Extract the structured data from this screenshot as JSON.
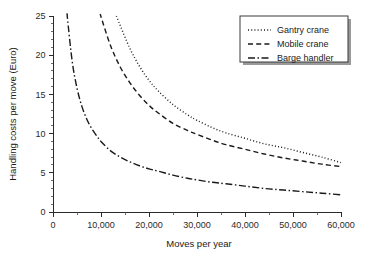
{
  "chart_data": {
    "type": "line",
    "title": "",
    "xlabel": "Moves per year",
    "ylabel": "Handling costs per move (Euro)",
    "xlim": [
      0,
      60000
    ],
    "ylim": [
      0,
      25
    ],
    "grid": false,
    "legend_position": "top-right",
    "x_ticks": [
      0,
      10000,
      20000,
      30000,
      40000,
      50000,
      60000
    ],
    "x_tick_labels": [
      "0",
      "10,000",
      "20,000",
      "30,000",
      "40,000",
      "50,000",
      "60,000"
    ],
    "x_minor_interval": 5000,
    "y_ticks": [
      0,
      5,
      10,
      15,
      20,
      25
    ],
    "y_tick_labels": [
      "0",
      "5",
      "10",
      "15",
      "20",
      "25"
    ],
    "y_minor_interval": 1,
    "x": [
      3000,
      4000,
      5000,
      6000,
      7000,
      8000,
      9000,
      10000,
      12000,
      14000,
      16000,
      18000,
      20000,
      22000,
      25000,
      28000,
      30000,
      33000,
      36000,
      40000,
      44000,
      48000,
      52000,
      56000,
      60000
    ],
    "series": [
      {
        "name": "Gantry crane",
        "style": "dotted",
        "x_start": 13200,
        "values": [
          null,
          null,
          null,
          null,
          null,
          null,
          null,
          null,
          null,
          23.8,
          20.9,
          18.6,
          16.8,
          15.4,
          13.7,
          12.4,
          11.7,
          10.8,
          10.1,
          9.4,
          8.7,
          8.2,
          7.6,
          7.0,
          6.3
        ]
      },
      {
        "name": "Mobile crane",
        "style": "dashed",
        "x_start": 10000,
        "values": [
          null,
          null,
          null,
          null,
          null,
          null,
          null,
          24.9,
          21.2,
          18.5,
          16.5,
          14.9,
          13.6,
          12.6,
          11.3,
          10.4,
          9.9,
          9.2,
          8.6,
          8.0,
          7.4,
          6.9,
          6.5,
          6.1,
          5.8
        ]
      },
      {
        "name": "Barge handler",
        "style": "dashdot",
        "x_start": 3000,
        "values": [
          24.8,
          19.2,
          15.8,
          13.5,
          11.9,
          10.7,
          9.8,
          9.0,
          7.8,
          7.0,
          6.4,
          5.9,
          5.5,
          5.2,
          4.7,
          4.3,
          4.1,
          3.8,
          3.6,
          3.3,
          3.0,
          2.8,
          2.6,
          2.4,
          2.2
        ]
      }
    ]
  },
  "legend": {
    "entries": [
      {
        "label": "Gantry crane",
        "style": "dotted"
      },
      {
        "label": "Mobile crane",
        "style": "dashed"
      },
      {
        "label": "Barge handler",
        "style": "dashdot"
      }
    ]
  },
  "colors": {
    "line": "#1a1a1a",
    "axis": "#2a2a2a",
    "background": "#ffffff",
    "legend_shadow": "#9a9a9a"
  }
}
